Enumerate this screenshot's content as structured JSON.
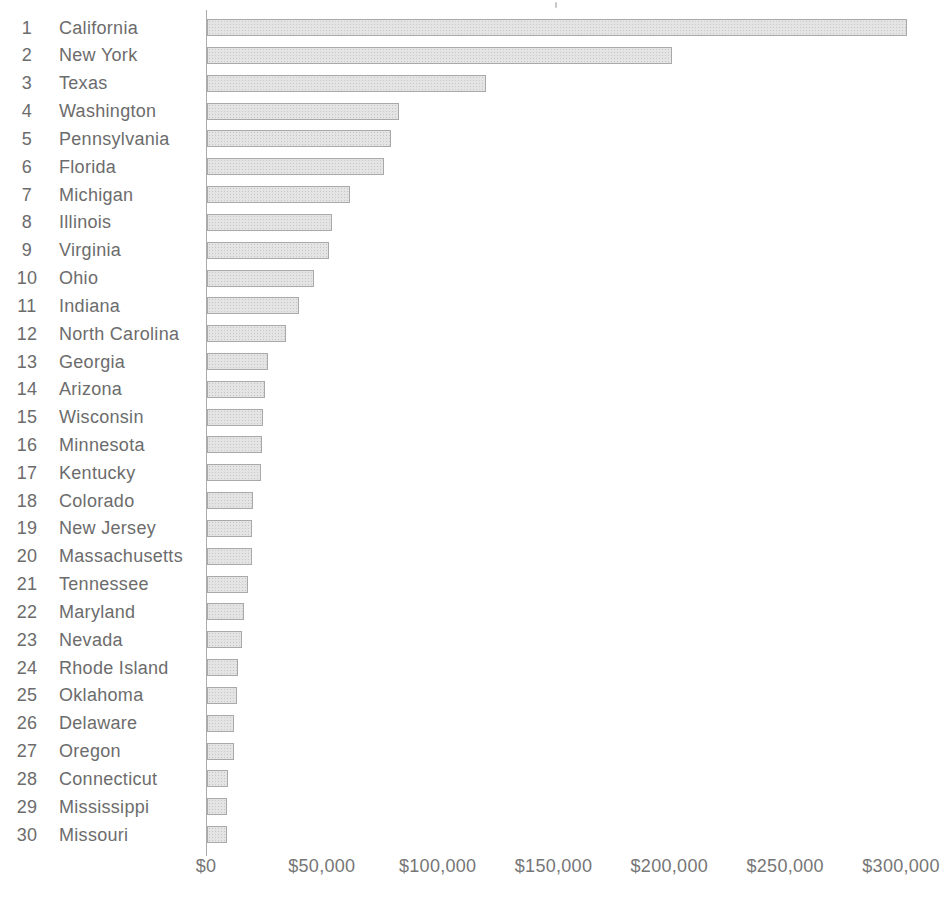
{
  "page": {
    "background": "#ffffff"
  },
  "chart_data": {
    "type": "bar",
    "orientation": "horizontal",
    "title": "",
    "xlabel": "",
    "ylabel": "",
    "grid": false,
    "legend": "none",
    "x_axis": {
      "min": 0,
      "max": 300000,
      "tick_values": [
        0,
        50000,
        100000,
        150000,
        200000,
        250000,
        300000
      ],
      "tick_labels": [
        "$0",
        "$50,000",
        "$100,000",
        "$150,000",
        "$200,000",
        "$250,000",
        "$300,000"
      ]
    },
    "rows": [
      {
        "rank": "1",
        "state": "California",
        "value": 302000
      },
      {
        "rank": "2",
        "state": "New York",
        "value": 200500
      },
      {
        "rank": "3",
        "state": "Texas",
        "value": 120500
      },
      {
        "rank": "4",
        "state": "Washington",
        "value": 83000
      },
      {
        "rank": "5",
        "state": "Pennsylvania",
        "value": 79500
      },
      {
        "rank": "6",
        "state": "Florida",
        "value": 76500
      },
      {
        "rank": "7",
        "state": "Michigan",
        "value": 61500
      },
      {
        "rank": "8",
        "state": "Illinois",
        "value": 54000
      },
      {
        "rank": "9",
        "state": "Virginia",
        "value": 52500
      },
      {
        "rank": "10",
        "state": "Ohio",
        "value": 46000
      },
      {
        "rank": "11",
        "state": "Indiana",
        "value": 39500
      },
      {
        "rank": "12",
        "state": "North Carolina",
        "value": 34000
      },
      {
        "rank": "13",
        "state": "Georgia",
        "value": 26500
      },
      {
        "rank": "14",
        "state": "Arizona",
        "value": 25000
      },
      {
        "rank": "15",
        "state": "Wisconsin",
        "value": 24200
      },
      {
        "rank": "16",
        "state": "Minnesota",
        "value": 23800
      },
      {
        "rank": "17",
        "state": "Kentucky",
        "value": 23500
      },
      {
        "rank": "18",
        "state": "Colorado",
        "value": 19800
      },
      {
        "rank": "19",
        "state": "New Jersey",
        "value": 19600
      },
      {
        "rank": "20",
        "state": "Massachusetts",
        "value": 19400
      },
      {
        "rank": "21",
        "state": "Tennessee",
        "value": 17500
      },
      {
        "rank": "22",
        "state": "Maryland",
        "value": 16000
      },
      {
        "rank": "23",
        "state": "Nevada",
        "value": 15000
      },
      {
        "rank": "24",
        "state": "Rhode Island",
        "value": 13500
      },
      {
        "rank": "25",
        "state": "Oklahoma",
        "value": 13000
      },
      {
        "rank": "26",
        "state": "Delaware",
        "value": 11700
      },
      {
        "rank": "27",
        "state": "Oregon",
        "value": 11500
      },
      {
        "rank": "28",
        "state": "Connecticut",
        "value": 9000
      },
      {
        "rank": "29",
        "state": "Mississippi",
        "value": 8700
      },
      {
        "rank": "30",
        "state": "Missouri",
        "value": 8500
      }
    ],
    "colors": {
      "bar_fill": "#e4e4e4",
      "bar_dot_texture": "#c7c7c7",
      "bar_border": "#a9a9a9",
      "axis_line": "#8f8f8f",
      "label_text": "#6c6c6c",
      "tick_text": "#767676"
    },
    "layout": {
      "axis_x_px": 206,
      "plot_span_px": 695,
      "first_row_center_y_px": 28,
      "row_pitch_px": 27.83
    }
  }
}
